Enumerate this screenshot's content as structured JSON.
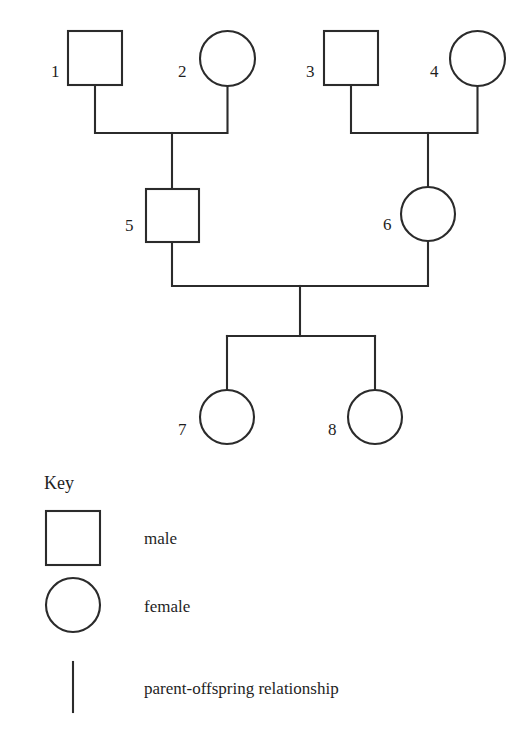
{
  "diagram": {
    "type": "pedigree",
    "line_color": "#2b2b2b",
    "fill_color": "#ffffff",
    "background": "#ffffff",
    "individuals": [
      {
        "id": "1",
        "label": "1",
        "sex": "male",
        "shape": "square",
        "generation": 1,
        "cx": 95,
        "cy": 58,
        "size": 54
      },
      {
        "id": "2",
        "label": "2",
        "sex": "female",
        "shape": "circle",
        "generation": 1,
        "cx": 227,
        "cy": 58,
        "size": 55
      },
      {
        "id": "3",
        "label": "3",
        "sex": "male",
        "shape": "square",
        "generation": 1,
        "cx": 351,
        "cy": 58,
        "size": 54
      },
      {
        "id": "4",
        "label": "4",
        "sex": "female",
        "shape": "circle",
        "generation": 1,
        "cx": 477,
        "cy": 58,
        "size": 55
      },
      {
        "id": "5",
        "label": "5",
        "sex": "male",
        "shape": "square",
        "generation": 2,
        "cx": 172,
        "cy": 215,
        "size": 53
      },
      {
        "id": "6",
        "label": "6",
        "sex": "female",
        "shape": "circle",
        "generation": 2,
        "cx": 428,
        "cy": 214,
        "size": 54
      },
      {
        "id": "7",
        "label": "7",
        "sex": "female",
        "shape": "circle",
        "generation": 3,
        "cx": 227,
        "cy": 417,
        "size": 54
      },
      {
        "id": "8",
        "label": "8",
        "sex": "female",
        "shape": "circle",
        "generation": 3,
        "cx": 375,
        "cy": 417,
        "size": 54
      }
    ],
    "matings": [
      {
        "partners": [
          "1",
          "2"
        ],
        "children": [
          "5"
        ]
      },
      {
        "partners": [
          "3",
          "4"
        ],
        "children": [
          "6"
        ]
      },
      {
        "partners": [
          "5",
          "6"
        ],
        "children": [
          "7",
          "8"
        ]
      }
    ]
  },
  "key": {
    "title": "Key",
    "entries": [
      {
        "symbol": "square-symbol",
        "label": "male"
      },
      {
        "symbol": "circle-symbol",
        "label": "female"
      },
      {
        "symbol": "line-symbol",
        "label": "parent-offspring relationship"
      }
    ]
  }
}
